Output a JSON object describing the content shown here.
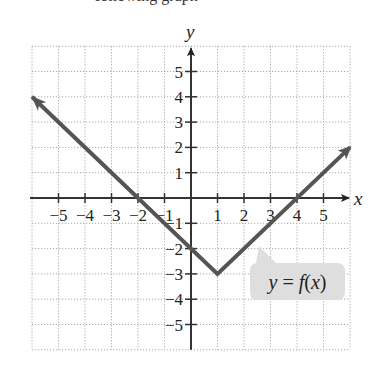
{
  "caption_fragment": "following graph",
  "chart_data": {
    "type": "line",
    "title": "",
    "xlabel": "x",
    "ylabel": "y",
    "xlim": [
      -6,
      6
    ],
    "ylim": [
      -6,
      6
    ],
    "grid": true,
    "grid_style": "dotted",
    "x_ticks": [
      -5,
      -4,
      -3,
      -2,
      -1,
      1,
      2,
      3,
      4,
      5
    ],
    "y_ticks": [
      -5,
      -4,
      -3,
      -2,
      -1,
      1,
      2,
      3,
      4,
      5
    ],
    "x_tick_labels": [
      "−5",
      "−4",
      "−3",
      "−2",
      "−1",
      "1",
      "2",
      "3",
      "4",
      "5"
    ],
    "y_tick_labels": [
      "−5",
      "−4",
      "−3",
      "−2",
      "−1",
      "1",
      "2",
      "3",
      "4",
      "5"
    ],
    "series": [
      {
        "name": "y = f(x)",
        "color": "#555555",
        "points": [
          [
            -6,
            4
          ],
          [
            1,
            -3
          ],
          [
            6,
            2
          ]
        ],
        "arrows": "both",
        "x_intercepts": [
          -2,
          4
        ],
        "y_intercept": -2,
        "vertex": [
          1,
          -3
        ]
      }
    ],
    "annotations": [
      {
        "text": "y = f(x)",
        "style": "callout",
        "position": "lower-right",
        "points_to": [
          3,
          -1.9
        ]
      }
    ],
    "legend": "none"
  },
  "labels": {
    "x_axis": "x",
    "y_axis": "y",
    "callout": "y = f(x)"
  },
  "colors": {
    "line": "#555555",
    "axis": "#333333",
    "grid": "#aaaaaa",
    "callout_bg": "#dcdcdc"
  }
}
